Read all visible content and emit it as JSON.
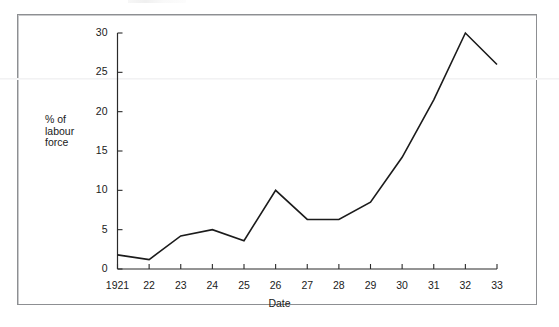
{
  "figure": {
    "background_color": "#ffffff",
    "frame_color": "#8d8f92",
    "line_color": "#1b1b1b",
    "axis_color": "#2a2a2a",
    "y_axis_title": "% of\nlabour\nforce"
  },
  "chart_data": {
    "type": "line",
    "title": "",
    "subtitle": "",
    "xlabel": "Date",
    "ylabel": "% of labour force",
    "categories": [
      "1921",
      "22",
      "23",
      "24",
      "25",
      "26",
      "27",
      "28",
      "29",
      "30",
      "31",
      "32",
      "33"
    ],
    "x_tick_labels": [
      "1921",
      "22",
      "23",
      "24",
      "25",
      "26",
      "27",
      "28",
      "29",
      "30",
      "31",
      "32",
      "33"
    ],
    "y_tick_labels": [
      "0",
      "5",
      "10",
      "15",
      "20",
      "25",
      "30"
    ],
    "y_ticks": [
      0,
      5,
      10,
      15,
      20,
      25,
      30
    ],
    "values": [
      1.8,
      1.2,
      4.2,
      5.0,
      3.6,
      10.0,
      6.3,
      6.3,
      8.5,
      14.2,
      21.5,
      30.0,
      26.0
    ],
    "series": [
      {
        "name": "Unemployment",
        "values": [
          1.8,
          1.2,
          4.2,
          5.0,
          3.6,
          10.0,
          6.3,
          6.3,
          8.5,
          14.2,
          21.5,
          30.0,
          26.0
        ]
      }
    ],
    "xlim": [
      0,
      12
    ],
    "ylim": [
      0,
      30
    ],
    "grid": false,
    "legend": false,
    "legend_position": "none",
    "annotations": []
  }
}
